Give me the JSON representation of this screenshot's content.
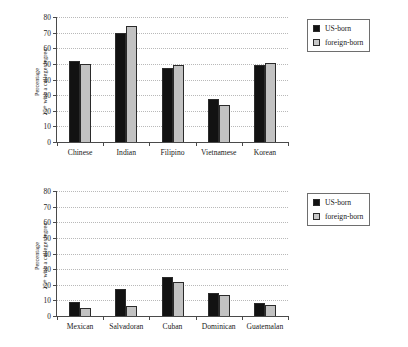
{
  "figure": {
    "ylabel_line1": "Percentage",
    "ylabel_line2": "25+ with a college degree"
  },
  "legend": {
    "us_born": "US-born",
    "foreign_born": "foreign-born",
    "us_born_color": "#121212",
    "foreign_born_color": "#c9c9c9"
  },
  "chart_data": [
    {
      "type": "bar",
      "title": "",
      "panel": "top",
      "xlabel": "",
      "ylabel": "Percentage 25+ with a college degree",
      "categories": [
        "Chinese",
        "Indian",
        "Filipino",
        "Vietnamese",
        "Korean"
      ],
      "series": [
        {
          "name": "US-born",
          "values": [
            52,
            70,
            47.5,
            27.5,
            49.5
          ]
        },
        {
          "name": "foreign-born",
          "values": [
            50,
            74,
            49.5,
            23.5,
            50.5
          ]
        }
      ],
      "yticks": [
        0,
        10,
        20,
        30,
        40,
        50,
        60,
        70,
        80
      ],
      "ylim": [
        0,
        80
      ],
      "grid": true,
      "legend_position": "right"
    },
    {
      "type": "bar",
      "title": "",
      "panel": "bottom",
      "xlabel": "",
      "ylabel": "Percentage 25+ with a college degree",
      "categories": [
        "Mexican",
        "Salvadoran",
        "Cuban",
        "Dominican",
        "Guatemalan"
      ],
      "series": [
        {
          "name": "US-born",
          "values": [
            9,
            17.5,
            25,
            15,
            8.5
          ]
        },
        {
          "name": "foreign-born",
          "values": [
            5,
            6.5,
            22,
            13.5,
            7
          ]
        }
      ],
      "yticks": [
        0,
        10,
        20,
        30,
        40,
        50,
        60,
        70,
        80
      ],
      "ylim": [
        0,
        80
      ],
      "grid": true,
      "legend_position": "right"
    }
  ]
}
